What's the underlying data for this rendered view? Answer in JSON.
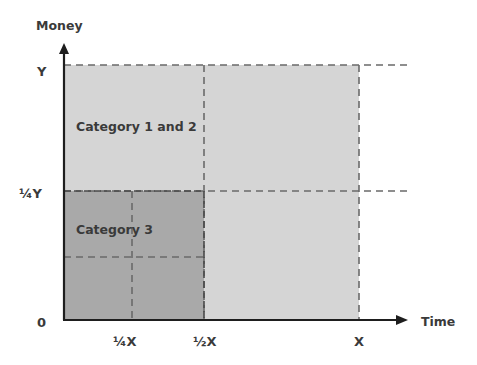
{
  "diagram": {
    "y_axis_label": "Money",
    "x_axis_label": "Time",
    "y_ticks": [
      {
        "label": "Y",
        "y": 72
      },
      {
        "label": "¼Y",
        "y": 198
      },
      {
        "label": "0",
        "y": 327
      }
    ],
    "x_ticks": [
      {
        "label": "¼X",
        "x": 122
      },
      {
        "label": "½X",
        "x": 204
      },
      {
        "label": "X",
        "x": 359
      }
    ],
    "regions": [
      {
        "name": "Category 1 and 2",
        "label": "Category 1 and 2",
        "color": "#d5d5d5"
      },
      {
        "name": "Category 3",
        "label": "Category 3",
        "color": "#a9a9a9"
      }
    ],
    "colors": {
      "axis": "#1e1e1e",
      "dash": "#6a6a6a",
      "light_region": "#d5d5d5",
      "dark_region": "#a9a9a9",
      "text": "#3a3a3a"
    }
  }
}
